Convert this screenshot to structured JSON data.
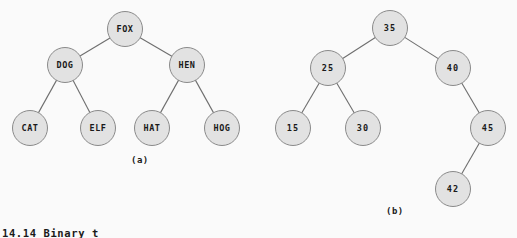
{
  "figure": {
    "background_color": "#fafafa",
    "node_fill_color": "#e2e2e2",
    "node_stroke_color": "#8a8a8a",
    "edge_color": "#6e6e6e",
    "text_color": "#1a1a1a",
    "caption": "14.14  Binary t"
  },
  "trees": [
    {
      "id": "tree-a",
      "sublabel": "(a)",
      "sublabel_x": 131,
      "sublabel_y": 155,
      "node_radius": 18,
      "nodes": [
        {
          "id": "fox",
          "label": "FOX",
          "x": 125,
          "y": 29,
          "level": 0
        },
        {
          "id": "dog",
          "label": "DOG",
          "x": 65,
          "y": 65,
          "level": 1
        },
        {
          "id": "hen",
          "label": "HEN",
          "x": 187,
          "y": 65,
          "level": 1
        },
        {
          "id": "cat",
          "label": "CAT",
          "x": 30,
          "y": 128,
          "level": 2
        },
        {
          "id": "elf",
          "label": "ELF",
          "x": 98,
          "y": 128,
          "level": 2
        },
        {
          "id": "hat",
          "label": "HAT",
          "x": 152,
          "y": 128,
          "level": 2
        },
        {
          "id": "hog",
          "label": "HOG",
          "x": 222,
          "y": 128,
          "level": 2
        }
      ],
      "edges": [
        {
          "from": "fox",
          "to": "dog"
        },
        {
          "from": "fox",
          "to": "hen"
        },
        {
          "from": "dog",
          "to": "cat"
        },
        {
          "from": "dog",
          "to": "elf"
        },
        {
          "from": "hen",
          "to": "hat"
        },
        {
          "from": "hen",
          "to": "hog"
        }
      ]
    },
    {
      "id": "tree-b",
      "sublabel": "(b)",
      "sublabel_x": 386,
      "sublabel_y": 206,
      "node_radius": 18,
      "nodes": [
        {
          "id": "n35",
          "label": "35",
          "x": 390,
          "y": 28,
          "level": 0
        },
        {
          "id": "n25",
          "label": "25",
          "x": 328,
          "y": 68,
          "level": 1
        },
        {
          "id": "n40",
          "label": "40",
          "x": 453,
          "y": 68,
          "level": 1
        },
        {
          "id": "n15",
          "label": "15",
          "x": 293,
          "y": 128,
          "level": 2
        },
        {
          "id": "n30",
          "label": "30",
          "x": 363,
          "y": 128,
          "level": 2
        },
        {
          "id": "n45",
          "label": "45",
          "x": 488,
          "y": 128,
          "level": 2
        },
        {
          "id": "n42",
          "label": "42",
          "x": 453,
          "y": 189,
          "level": 3
        }
      ],
      "edges": [
        {
          "from": "n35",
          "to": "n25"
        },
        {
          "from": "n35",
          "to": "n40"
        },
        {
          "from": "n25",
          "to": "n15"
        },
        {
          "from": "n25",
          "to": "n30"
        },
        {
          "from": "n40",
          "to": "n45"
        },
        {
          "from": "n45",
          "to": "n42"
        }
      ]
    }
  ]
}
